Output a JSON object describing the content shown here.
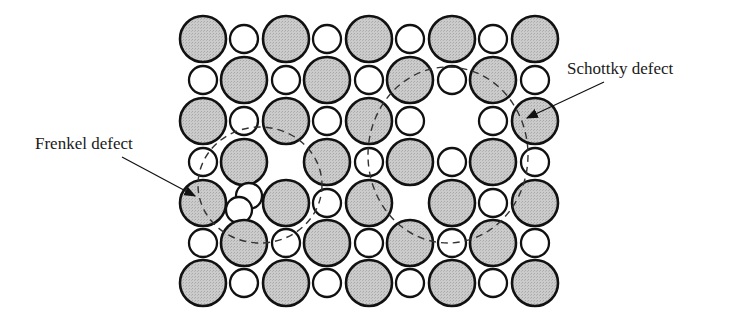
{
  "diagram": {
    "labels": {
      "frenkel": "Frenkel defect",
      "schottky": "Schottky defect"
    },
    "colors": {
      "large_fill": "#c9c9c9",
      "small_fill": "#ffffff",
      "stroke": "#111111",
      "dashed": "#333333"
    },
    "lattice": {
      "x": [
        203,
        244,
        286,
        327,
        369,
        410,
        452,
        493,
        535
      ],
      "y": [
        39,
        80,
        121,
        162,
        203,
        243,
        283
      ],
      "large_r": 23,
      "small_r": 14,
      "missing": [
        [
          2,
          6
        ],
        [
          3,
          2
        ],
        [
          4,
          5
        ]
      ],
      "frenkel_interstitial_cell": [
        4,
        1
      ]
    }
  }
}
